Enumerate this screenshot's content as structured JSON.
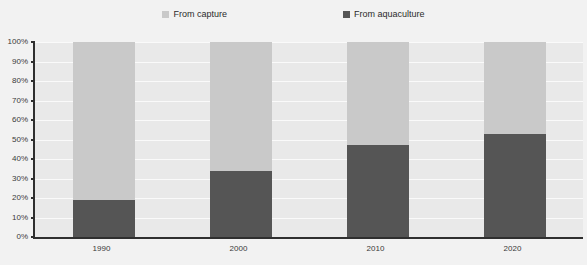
{
  "chart_data": {
    "type": "bar",
    "subtype": "100% stacked bar",
    "title": "",
    "xlabel": "",
    "ylabel": "",
    "categories": [
      "1990",
      "2000",
      "2010",
      "2020"
    ],
    "ylim": [
      0,
      100
    ],
    "yunit": "%",
    "ytick_labels": [
      "0%",
      "10%",
      "20%",
      "30%",
      "40%",
      "50%",
      "60%",
      "70%",
      "80%",
      "90%",
      "100%"
    ],
    "ytick_values": [
      0,
      10,
      20,
      30,
      40,
      50,
      60,
      70,
      80,
      90,
      100
    ],
    "grid": true,
    "legend_position": "top",
    "series": [
      {
        "name": "From capture",
        "color": "#c9c9c9",
        "values": [
          81,
          66,
          53,
          47
        ]
      },
      {
        "name": "From aquaculture",
        "color": "#555555",
        "values": [
          19,
          34,
          47,
          53
        ]
      }
    ]
  },
  "legend": {
    "items": [
      {
        "label": "From capture",
        "color": "#c9c9c9"
      },
      {
        "label": "From aquaculture",
        "color": "#555555"
      }
    ]
  },
  "colors": {
    "background": "#f2f2f2",
    "plot_background": "#e9e9e9",
    "axis": "#2f2f2f",
    "gridline": "#fafafa",
    "capture": "#c9c9c9",
    "aquaculture": "#555555",
    "text": "#3a3a3a"
  }
}
